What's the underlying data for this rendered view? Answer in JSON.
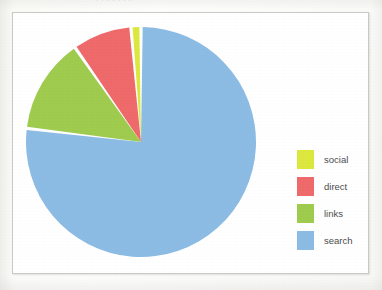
{
  "figure": {
    "frame_border_color": "#c9c9c6",
    "background_color": "#ffffff",
    "page_color": "#fdfdfc",
    "title_remnant": "· · · · · · ·"
  },
  "legend": {
    "position": "right",
    "entries": [
      {
        "label": "social",
        "color": "#dce83e",
        "swatch_name": "legend-swatch-social"
      },
      {
        "label": "direct",
        "color": "#ef6a6a",
        "swatch_name": "legend-swatch-direct"
      },
      {
        "label": "links",
        "color": "#9fcb4f",
        "swatch_name": "legend-swatch-links"
      },
      {
        "label": "search",
        "color": "#8cbce4",
        "swatch_name": "legend-swatch-search"
      }
    ]
  },
  "chart_data": {
    "type": "pie",
    "title": "",
    "subtitle": "",
    "xlabel": "",
    "ylabel": "",
    "grid": false,
    "legend_position": "right",
    "start_angle_deg": 90,
    "direction": "counterclockwise",
    "separator_color": "#ffffff",
    "separator_width_px": 2,
    "center_px": [
      141,
      142
    ],
    "radius_px": 104,
    "labels": [
      "social",
      "direct",
      "links",
      "search"
    ],
    "values": [
      1.4,
      8.3,
      13.4,
      76.9
    ],
    "colors": [
      "#dce83e",
      "#ef6a6a",
      "#9fcb4f",
      "#8cbce4"
    ],
    "slices": [
      {
        "label": "social",
        "value": 1.4,
        "percent": "1.4%",
        "color": "#dce83e",
        "angle_deg": 5.0,
        "start_deg": 90.0,
        "end_deg": 95.0
      },
      {
        "label": "direct",
        "value": 8.3,
        "percent": "8.3%",
        "color": "#ef6a6a",
        "angle_deg": 30.0,
        "start_deg": 95.0,
        "end_deg": 125.0
      },
      {
        "label": "links",
        "value": 13.4,
        "percent": "13.4%",
        "color": "#9fcb4f",
        "angle_deg": 48.0,
        "start_deg": 125.0,
        "end_deg": 173.0
      },
      {
        "label": "search",
        "value": 76.9,
        "percent": "76.9%",
        "color": "#8cbce4",
        "angle_deg": 277.0,
        "start_deg": 173.0,
        "end_deg": 450.0
      }
    ]
  }
}
